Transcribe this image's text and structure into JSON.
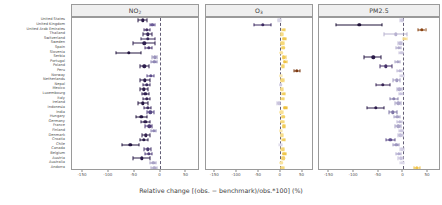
{
  "figure": {
    "xlabel": "Relative change [(obs. − benchmark)/obs.*100] (%)",
    "zero_reference_color": "#55506a",
    "panel_strip_color": "#efefef",
    "frame_color": "#9a9a9a"
  },
  "categories": [
    "United States",
    "United Kingdom",
    "United Arab Emirates",
    "Thailand",
    "Switzerland",
    "Sweden",
    "Spain",
    "Slovenia",
    "Serbia",
    "Portugal",
    "Poland",
    "Peru",
    "Norway",
    "Netherlands",
    "Nepal",
    "Mexico",
    "Luxembourg",
    "Italy",
    "Ireland",
    "Indonesia",
    "India",
    "Hungary",
    "Germany",
    "France",
    "Finland",
    "Denmark",
    "Croatia",
    "Chile",
    "Canada",
    "Belgium",
    "Austria",
    "Australia",
    "Andorra"
  ],
  "axis": {
    "ticks": [
      -150,
      -100,
      -50,
      0,
      50
    ],
    "ticklabels": [
      "-150",
      "-100",
      "-50",
      "0",
      "50"
    ],
    "xmin": -170,
    "xmax": 75
  },
  "chart_data": {
    "type": "scatter",
    "title": "",
    "xlabel": "Relative change [(obs. − benchmark)/obs.*100] (%)",
    "ylabel": "",
    "xlim": [
      -170,
      75
    ],
    "grid": false,
    "legend": "none",
    "panels": [
      {
        "name": "NO2",
        "title_main": "NO",
        "title_sub": "2",
        "points": [
          {
            "category": "United States",
            "value": -33,
            "lo": -42,
            "hi": -25,
            "color": "#2a1a47"
          },
          {
            "category": "United Kingdom",
            "value": -15,
            "lo": -20,
            "hi": -10,
            "color": "#6a5a96"
          },
          {
            "category": "United Arab Emirates",
            "value": -25,
            "lo": -30,
            "hi": -20,
            "color": "#463268"
          },
          {
            "category": "Thailand",
            "value": -24,
            "lo": -33,
            "hi": -16,
            "color": "#352455"
          },
          {
            "category": "Switzerland",
            "value": -23,
            "lo": -37,
            "hi": -9,
            "color": "#3b2a5c"
          },
          {
            "category": "Sweden",
            "value": -30,
            "lo": -52,
            "hi": -10,
            "color": "#2e1f4e"
          },
          {
            "category": "Spain",
            "value": -22,
            "lo": -28,
            "hi": -16,
            "color": "#4a3670"
          },
          {
            "category": "Slovenia",
            "value": -60,
            "lo": -85,
            "hi": -37,
            "color": "#241640"
          },
          {
            "category": "Serbia",
            "value": -10,
            "lo": -16,
            "hi": -5,
            "color": "#9a93bb"
          },
          {
            "category": "Portugal",
            "value": -11,
            "lo": -17,
            "hi": -6,
            "color": "#8e86b4"
          },
          {
            "category": "Poland",
            "value": -30,
            "lo": -38,
            "hi": -22,
            "color": "#2d1e4d"
          },
          {
            "category": "Norway",
            "value": -18,
            "lo": -25,
            "hi": -11,
            "color": "#5d4d8a"
          },
          {
            "category": "Netherlands",
            "value": -29,
            "lo": -38,
            "hi": -20,
            "color": "#2b1c4b"
          },
          {
            "category": "Nepal",
            "value": -26,
            "lo": -33,
            "hi": -20,
            "color": "#3a2a5e"
          },
          {
            "category": "Mexico",
            "value": -31,
            "lo": -39,
            "hi": -23,
            "color": "#2a1a47"
          },
          {
            "category": "Luxembourg",
            "value": -28,
            "lo": -35,
            "hi": -21,
            "color": "#30204f"
          },
          {
            "category": "Italy",
            "value": -26,
            "lo": -33,
            "hi": -19,
            "color": "#362453"
          },
          {
            "category": "Ireland",
            "value": -33,
            "lo": -42,
            "hi": -24,
            "color": "#261742"
          },
          {
            "category": "Indonesia",
            "value": -24,
            "lo": -31,
            "hi": -18,
            "color": "#3c2a60"
          },
          {
            "category": "India",
            "value": -19,
            "lo": -26,
            "hi": -12,
            "color": "#564784"
          },
          {
            "category": "Hungary",
            "value": -36,
            "lo": -46,
            "hi": -26,
            "color": "#231540"
          },
          {
            "category": "Germany",
            "value": -28,
            "lo": -36,
            "hi": -20,
            "color": "#2f1f4e"
          },
          {
            "category": "France",
            "value": -21,
            "lo": -28,
            "hi": -15,
            "color": "#4e3a76"
          },
          {
            "category": "Finland",
            "value": -12,
            "lo": -18,
            "hi": -7,
            "color": "#8f87b5"
          },
          {
            "category": "Denmark",
            "value": -27,
            "lo": -35,
            "hi": -20,
            "color": "#33224f"
          },
          {
            "category": "Croatia",
            "value": -31,
            "lo": -39,
            "hi": -23,
            "color": "#281a46"
          },
          {
            "category": "Chile",
            "value": -57,
            "lo": -74,
            "hi": -41,
            "color": "#221440"
          },
          {
            "category": "Canada",
            "value": -23,
            "lo": -30,
            "hi": -17,
            "color": "#4a3a70"
          },
          {
            "category": "Belgium",
            "value": -22,
            "lo": -29,
            "hi": -16,
            "color": "#513f7a"
          },
          {
            "category": "Austria",
            "value": -35,
            "lo": -52,
            "hi": -20,
            "color": "#2a1c4a"
          },
          {
            "category": "Australia",
            "value": -13,
            "lo": -19,
            "hi": -8,
            "color": "#a9a2c6"
          },
          {
            "category": "Andorra",
            "value": -11,
            "lo": -17,
            "hi": -6,
            "color": "#b2abcb"
          }
        ]
      },
      {
        "name": "O3",
        "title_main": "O",
        "title_sub": "3",
        "points": [
          {
            "category": "United States",
            "value": -2,
            "lo": -5,
            "hi": 1,
            "color": "#d8d6e6"
          },
          {
            "category": "United Kingdom",
            "value": -40,
            "lo": -60,
            "hi": -20,
            "color": "#3d2a62"
          },
          {
            "category": "United Arab Emirates",
            "value": 8,
            "lo": 5,
            "hi": 11,
            "color": "#f2cf62"
          },
          {
            "category": "Thailand",
            "value": 4,
            "lo": 2,
            "hi": 6,
            "color": "#f7dc85"
          },
          {
            "category": "Switzerland",
            "value": 10,
            "lo": 7,
            "hi": 13,
            "color": "#f0c84f"
          },
          {
            "category": "Sweden",
            "value": 5,
            "lo": 3,
            "hi": 8,
            "color": "#f6d877"
          },
          {
            "category": "Spain",
            "value": 7,
            "lo": 4,
            "hi": 10,
            "color": "#f3d164"
          },
          {
            "category": "Slovenia",
            "value": 3,
            "lo": 1,
            "hi": 5,
            "color": "#f8e098"
          },
          {
            "category": "Serbia",
            "value": 9,
            "lo": 6,
            "hi": 13,
            "color": "#f1ca56"
          },
          {
            "category": "Portugal",
            "value": 11,
            "lo": 8,
            "hi": 15,
            "color": "#efc244"
          },
          {
            "category": "Poland",
            "value": 6,
            "lo": 4,
            "hi": 9,
            "color": "#f5d570"
          },
          {
            "category": "Peru",
            "value": 38,
            "lo": 32,
            "hi": 45,
            "color": "#7d3a12"
          },
          {
            "category": "Norway",
            "value": 2,
            "lo": 0,
            "hi": 4,
            "color": "#fae8b0"
          },
          {
            "category": "Netherlands",
            "value": 5,
            "lo": 3,
            "hi": 8,
            "color": "#f6d87c"
          },
          {
            "category": "Nepal",
            "value": 1,
            "lo": -1,
            "hi": 3,
            "color": "#cfcbe1"
          },
          {
            "category": "Mexico",
            "value": 4,
            "lo": 2,
            "hi": 7,
            "color": "#f7dc88"
          },
          {
            "category": "Luxembourg",
            "value": 8,
            "lo": 5,
            "hi": 11,
            "color": "#f2cd5c"
          },
          {
            "category": "Italy",
            "value": 6,
            "lo": 3,
            "hi": 9,
            "color": "#f5d66f"
          },
          {
            "category": "Ireland",
            "value": -3,
            "lo": -6,
            "hi": 0,
            "color": "#c9c4dd"
          },
          {
            "category": "Indonesia",
            "value": 12,
            "lo": 8,
            "hi": 16,
            "color": "#eebf3c"
          },
          {
            "category": "India",
            "value": 3,
            "lo": 1,
            "hi": 6,
            "color": "#f8e094"
          },
          {
            "category": "Hungary",
            "value": 7,
            "lo": 4,
            "hi": 10,
            "color": "#f3d267"
          },
          {
            "category": "Germany",
            "value": 5,
            "lo": 3,
            "hi": 8,
            "color": "#f6d879"
          },
          {
            "category": "France",
            "value": 9,
            "lo": 6,
            "hi": 12,
            "color": "#f1cb58"
          },
          {
            "category": "Finland",
            "value": 2,
            "lo": 0,
            "hi": 4,
            "color": "#fae7ad"
          },
          {
            "category": "Denmark",
            "value": 4,
            "lo": 2,
            "hi": 7,
            "color": "#f7dd8b"
          },
          {
            "category": "Croatia",
            "value": 8,
            "lo": 5,
            "hi": 11,
            "color": "#f2ce5f"
          },
          {
            "category": "Chile",
            "value": 1,
            "lo": -2,
            "hi": 4,
            "color": "#ddd9ea"
          },
          {
            "category": "Canada",
            "value": 6,
            "lo": 3,
            "hi": 9,
            "color": "#f5d572"
          },
          {
            "category": "Belgium",
            "value": 10,
            "lo": 7,
            "hi": 14,
            "color": "#efc54a"
          },
          {
            "category": "Austria",
            "value": 7,
            "lo": 4,
            "hi": 10,
            "color": "#f3d06a"
          },
          {
            "category": "Australia",
            "value": 3,
            "lo": 1,
            "hi": 5,
            "color": "#f9e39e"
          },
          {
            "category": "Andorra",
            "value": 5,
            "lo": 2,
            "hi": 8,
            "color": "#f6d97f"
          }
        ]
      },
      {
        "name": "PM2.5",
        "title_main": "PM2.5",
        "title_sub": "",
        "points": [
          {
            "category": "United States",
            "value": -2,
            "lo": -5,
            "hi": 1,
            "color": "#cfcbe2"
          },
          {
            "category": "United Kingdom",
            "value": -88,
            "lo": -135,
            "hi": -42,
            "color": "#1f1238"
          },
          {
            "category": "United Arab Emirates",
            "value": 38,
            "lo": 30,
            "hi": 46,
            "color": "#8a4412"
          },
          {
            "category": "Thailand",
            "value": -14,
            "lo": -38,
            "hi": 8,
            "color": "#b7b1d0"
          },
          {
            "category": "Switzerland",
            "value": 4,
            "lo": 1,
            "hi": 8,
            "color": "#f6dc8e"
          },
          {
            "category": "Sweden",
            "value": -5,
            "lo": -9,
            "hi": -1,
            "color": "#c1bcd8"
          },
          {
            "category": "Spain",
            "value": -8,
            "lo": -14,
            "hi": -3,
            "color": "#b0aacb"
          },
          {
            "category": "Slovenia",
            "value": -3,
            "lo": -7,
            "hi": 1,
            "color": "#cdc8e0"
          },
          {
            "category": "Serbia",
            "value": -60,
            "lo": -78,
            "hi": -44,
            "color": "#2a1a48"
          },
          {
            "category": "Portugal",
            "value": -10,
            "lo": -16,
            "hi": -5,
            "color": "#a9a3c6"
          },
          {
            "category": "Poland",
            "value": -34,
            "lo": -46,
            "hi": -22,
            "color": "#45316a"
          },
          {
            "category": "Peru",
            "value": -6,
            "lo": -11,
            "hi": -2,
            "color": "#bdb7d5"
          },
          {
            "category": "Norway",
            "value": -2,
            "lo": -6,
            "hi": 2,
            "color": "#d4d0e4"
          },
          {
            "category": "Netherlands",
            "value": -12,
            "lo": -19,
            "hi": -6,
            "color": "#a29bc1"
          },
          {
            "category": "Nepal",
            "value": -40,
            "lo": -54,
            "hi": -27,
            "color": "#382556"
          },
          {
            "category": "Mexico",
            "value": -7,
            "lo": -12,
            "hi": -2,
            "color": "#b5afcf"
          },
          {
            "category": "Luxembourg",
            "value": -4,
            "lo": -8,
            "hi": 0,
            "color": "#c8c3de"
          },
          {
            "category": "Italy",
            "value": -18,
            "lo": -26,
            "hi": -10,
            "color": "#8a82ae"
          },
          {
            "category": "Ireland",
            "value": -9,
            "lo": -15,
            "hi": -4,
            "color": "#aba5c8"
          },
          {
            "category": "Indonesia",
            "value": -55,
            "lo": -72,
            "hi": -39,
            "color": "#2d1c4c"
          },
          {
            "category": "India",
            "value": -20,
            "lo": -28,
            "hi": -12,
            "color": "#7f76a6"
          },
          {
            "category": "Hungary",
            "value": -11,
            "lo": -17,
            "hi": -5,
            "color": "#a7a1c5"
          },
          {
            "category": "Germany",
            "value": -6,
            "lo": -11,
            "hi": -1,
            "color": "#bcb6d4"
          },
          {
            "category": "France",
            "value": -9,
            "lo": -15,
            "hi": -4,
            "color": "#aaa4c7"
          },
          {
            "category": "Finland",
            "value": -3,
            "lo": -7,
            "hi": 1,
            "color": "#cbc6df"
          },
          {
            "category": "Denmark",
            "value": -5,
            "lo": -10,
            "hi": 0,
            "color": "#c3bed9"
          },
          {
            "category": "Croatia",
            "value": -25,
            "lo": -34,
            "hi": -16,
            "color": "#5e4e8c"
          },
          {
            "category": "Chile",
            "value": -13,
            "lo": -20,
            "hi": -7,
            "color": "#9d96bf"
          },
          {
            "category": "Canada",
            "value": -2,
            "lo": -6,
            "hi": 2,
            "color": "#d2cee3"
          },
          {
            "category": "Belgium",
            "value": -8,
            "lo": -14,
            "hi": -3,
            "color": "#b2acd0"
          },
          {
            "category": "Austria",
            "value": -4,
            "lo": -9,
            "hi": 0,
            "color": "#c7c2dd"
          },
          {
            "category": "Australia",
            "value": -1,
            "lo": -5,
            "hi": 3,
            "color": "#dbd8e9"
          },
          {
            "category": "Andorra",
            "value": 28,
            "lo": 22,
            "hi": 35,
            "color": "#f0c44a"
          }
        ]
      }
    ]
  }
}
